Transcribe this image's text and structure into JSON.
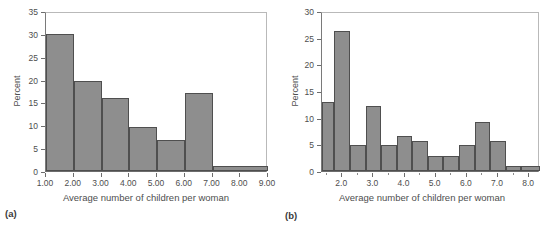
{
  "figure": {
    "background": "#ffffff",
    "bar_fill": "#8e8e8e",
    "bar_stroke": "#4f4f4f",
    "frame_color": "#b9b9b9",
    "axis_color": "#6d6d6d",
    "text_color": "#4e4e4e"
  },
  "panels": [
    {
      "caption": "(a)",
      "chart_data": {
        "type": "bar",
        "title": "",
        "subtitle": "",
        "xlabel": "Average number of children per woman",
        "ylabel": "Percent",
        "xlim": [
          1.0,
          9.0
        ],
        "ylim": [
          0,
          35
        ],
        "grid": false,
        "legend": null,
        "x_ticks": [
          1.0,
          2.0,
          3.0,
          4.0,
          5.0,
          6.0,
          7.0,
          8.0,
          9.0
        ],
        "x_tick_labels": [
          "1.00",
          "2.00",
          "3.00",
          "4.00",
          "5.00",
          "6.00",
          "7.00",
          "8.00",
          "9.00"
        ],
        "y_ticks": [
          0,
          5,
          10,
          15,
          20,
          25,
          30,
          35
        ],
        "y_tick_labels": [
          "0",
          "5",
          "10",
          "15",
          "20",
          "25",
          "30",
          "35"
        ],
        "bins": [
          {
            "x0": 1.0,
            "x1": 2.0,
            "value": 30.0
          },
          {
            "x0": 2.0,
            "x1": 3.0,
            "value": 19.8
          },
          {
            "x0": 3.0,
            "x1": 4.0,
            "value": 16.0
          },
          {
            "x0": 4.0,
            "x1": 5.0,
            "value": 9.7
          },
          {
            "x0": 5.0,
            "x1": 6.0,
            "value": 6.8
          },
          {
            "x0": 6.0,
            "x1": 7.0,
            "value": 17.0
          },
          {
            "x0": 7.0,
            "x1": 9.0,
            "value": 1.2
          }
        ]
      }
    },
    {
      "caption": "(b)",
      "chart_data": {
        "type": "bar",
        "title": "",
        "subtitle": "",
        "xlabel": "Average number of children per woman",
        "ylabel": "Percent",
        "xlim": [
          1.35,
          8.35
        ],
        "ylim": [
          0,
          30
        ],
        "grid": false,
        "legend": null,
        "x_ticks": [
          1.5,
          2.0,
          2.5,
          3.0,
          3.5,
          4.0,
          4.5,
          5.0,
          5.5,
          6.0,
          6.5,
          7.0,
          7.5,
          8.0
        ],
        "x_tick_labels": [
          "",
          "2.0",
          "",
          "3.0",
          "",
          "4.0",
          "",
          "5.0",
          "",
          "6.0",
          "",
          "7.0",
          "",
          "8.0"
        ],
        "y_ticks": [
          0,
          5,
          10,
          15,
          20,
          25,
          30
        ],
        "y_tick_labels": [
          "0",
          "5",
          "10",
          "15",
          "20",
          "25",
          "30"
        ],
        "bins": [
          {
            "x0": 1.35,
            "x1": 1.75,
            "value": 13.0
          },
          {
            "x0": 1.75,
            "x1": 2.25,
            "value": 26.2
          },
          {
            "x0": 2.25,
            "x1": 2.75,
            "value": 4.8
          },
          {
            "x0": 2.75,
            "x1": 3.25,
            "value": 12.2
          },
          {
            "x0": 3.25,
            "x1": 3.75,
            "value": 4.8
          },
          {
            "x0": 3.75,
            "x1": 4.25,
            "value": 6.5
          },
          {
            "x0": 4.25,
            "x1": 4.75,
            "value": 5.6
          },
          {
            "x0": 4.75,
            "x1": 5.25,
            "value": 2.9
          },
          {
            "x0": 5.25,
            "x1": 5.75,
            "value": 2.9
          },
          {
            "x0": 5.75,
            "x1": 6.25,
            "value": 4.8
          },
          {
            "x0": 6.25,
            "x1": 6.75,
            "value": 9.2
          },
          {
            "x0": 6.75,
            "x1": 7.25,
            "value": 5.6
          },
          {
            "x0": 7.25,
            "x1": 7.75,
            "value": 0.9
          },
          {
            "x0": 7.75,
            "x1": 8.35,
            "value": 1.0
          }
        ]
      }
    }
  ]
}
